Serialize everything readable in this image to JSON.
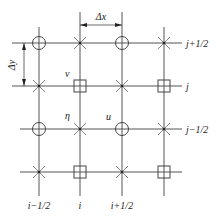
{
  "diagram": {
    "type": "staggered-grid",
    "colors": {
      "line": "#555555",
      "text": "#222222",
      "background": "#ffffff"
    },
    "columns": [
      {
        "x": 39,
        "label": "i−1/2"
      },
      {
        "x": 80,
        "label": "i"
      },
      {
        "x": 122,
        "label": "i+1/2"
      },
      {
        "x": 164,
        "label": ""
      }
    ],
    "rows": [
      {
        "y": 43,
        "label": "j+1/2"
      },
      {
        "y": 86,
        "label": "j"
      },
      {
        "y": 129,
        "label": "j−1/2"
      },
      {
        "y": 172,
        "label": ""
      }
    ],
    "dimensions": {
      "dx": "Δx",
      "dy": "Δy"
    },
    "variable_labels": {
      "v": "v",
      "eta": "η",
      "u": "u"
    },
    "legend_markers": {
      "circle": "circle-node (i±1/2, j±1/2)",
      "square": "square-node (i, j)",
      "cross": "cross-node"
    }
  }
}
